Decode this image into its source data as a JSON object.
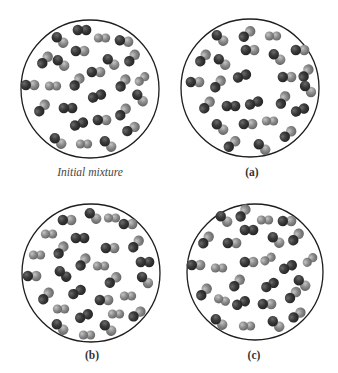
{
  "colors": {
    "dark_atom": "#343434",
    "dark_highlight": "#6a6a6a",
    "light_atom": "#8c8c8c",
    "light_highlight": "#c4c4c4",
    "circle_stroke": "#1e1e1e"
  },
  "legend": {
    "molecule_types": {
      "DD": "dark-dark diatomic molecule",
      "LL": "light-light diatomic molecule",
      "DL": "dark-light diatomic molecule"
    }
  },
  "panels": [
    {
      "id": "initial",
      "label": "Initial mixture",
      "label_style": "italic",
      "label_pos": [
        90,
        166
      ],
      "circle": {
        "cx": 90,
        "cy": 89,
        "r": 69
      },
      "molecules": [
        [
          82,
          30,
          0,
          "DD"
        ],
        [
          60,
          40,
          40,
          "DL"
        ],
        [
          102,
          38,
          0,
          "LL"
        ],
        [
          124,
          41,
          10,
          "DL"
        ],
        [
          80,
          51,
          0,
          "DL"
        ],
        [
          45,
          60,
          -50,
          "DL"
        ],
        [
          61,
          63,
          40,
          "DL"
        ],
        [
          111,
          62,
          40,
          "DL"
        ],
        [
          132,
          58,
          -50,
          "DL"
        ],
        [
          96,
          72,
          0,
          "DL"
        ],
        [
          30,
          85,
          0,
          "DL"
        ],
        [
          53,
          86,
          0,
          "LL"
        ],
        [
          77,
          82,
          -55,
          "DL"
        ],
        [
          142,
          79,
          -40,
          "LL"
        ],
        [
          123,
          83,
          -55,
          "DL"
        ],
        [
          97,
          96,
          -20,
          "DD"
        ],
        [
          140,
          98,
          50,
          "DL"
        ],
        [
          42,
          108,
          -50,
          "DL"
        ],
        [
          68,
          108,
          0,
          "DD"
        ],
        [
          123,
          112,
          -50,
          "DL"
        ],
        [
          79,
          124,
          -20,
          "DD"
        ],
        [
          102,
          120,
          0,
          "DL"
        ],
        [
          131,
          129,
          -30,
          "DL"
        ],
        [
          58,
          141,
          40,
          "DL"
        ],
        [
          84,
          144,
          0,
          "LL"
        ],
        [
          108,
          144,
          40,
          "DL"
        ]
      ]
    },
    {
      "id": "a",
      "label": "(a)",
      "label_style": "bold",
      "label_pos": [
        252,
        166
      ],
      "circle": {
        "cx": 250,
        "cy": 88,
        "r": 69
      },
      "molecules": [
        [
          220,
          38,
          40,
          "DL"
        ],
        [
          247,
          34,
          -40,
          "DL"
        ],
        [
          273,
          36,
          0,
          "LL"
        ],
        [
          250,
          50,
          0,
          "DL"
        ],
        [
          277,
          57,
          40,
          "DL"
        ],
        [
          300,
          50,
          0,
          "DL"
        ],
        [
          203,
          58,
          -50,
          "DL"
        ],
        [
          222,
          62,
          40,
          "DL"
        ],
        [
          242,
          76,
          -20,
          "DD"
        ],
        [
          287,
          77,
          0,
          "DL"
        ],
        [
          306,
          73,
          -55,
          "DL"
        ],
        [
          195,
          82,
          0,
          "DL"
        ],
        [
          218,
          84,
          -50,
          "DL"
        ],
        [
          308,
          89,
          45,
          "DL"
        ],
        [
          207,
          105,
          -50,
          "DL"
        ],
        [
          231,
          106,
          0,
          "DD"
        ],
        [
          254,
          103,
          -20,
          "DD"
        ],
        [
          283,
          100,
          -60,
          "DL"
        ],
        [
          300,
          110,
          -20,
          "DD"
        ],
        [
          220,
          127,
          40,
          "DL"
        ],
        [
          248,
          124,
          0,
          "DL"
        ],
        [
          270,
          121,
          0,
          "LL"
        ],
        [
          288,
          134,
          -40,
          "DL"
        ],
        [
          232,
          144,
          -40,
          "DL"
        ],
        [
          262,
          147,
          40,
          "DL"
        ]
      ]
    },
    {
      "id": "b",
      "label": "(b)",
      "label_style": "bold",
      "label_pos": [
        92,
        349
      ],
      "circle": {
        "cx": 91,
        "cy": 273,
        "r": 69
      },
      "molecules": [
        [
          67,
          220,
          0,
          "DL"
        ],
        [
          93,
          216,
          40,
          "DL"
        ],
        [
          112,
          218,
          0,
          "LL"
        ],
        [
          128,
          224,
          0,
          "DL"
        ],
        [
          49,
          234,
          0,
          "LL"
        ],
        [
          80,
          238,
          0,
          "DD"
        ],
        [
          61,
          250,
          -55,
          "DL"
        ],
        [
          110,
          248,
          0,
          "DL"
        ],
        [
          136,
          244,
          -50,
          "DL"
        ],
        [
          37,
          255,
          0,
          "LL"
        ],
        [
          83,
          262,
          -55,
          "DL"
        ],
        [
          101,
          266,
          0,
          "LL"
        ],
        [
          145,
          262,
          0,
          "DD"
        ],
        [
          32,
          276,
          0,
          "DL"
        ],
        [
          63,
          274,
          40,
          "DD"
        ],
        [
          113,
          280,
          -40,
          "DL"
        ],
        [
          145,
          280,
          45,
          "DL"
        ],
        [
          46,
          296,
          -50,
          "DL"
        ],
        [
          77,
          292,
          -30,
          "DD"
        ],
        [
          104,
          300,
          0,
          "DL"
        ],
        [
          128,
          296,
          0,
          "LL"
        ],
        [
          61,
          309,
          0,
          "LL"
        ],
        [
          84,
          316,
          -25,
          "DD"
        ],
        [
          116,
          314,
          0,
          "LL"
        ],
        [
          137,
          314,
          -35,
          "DL"
        ],
        [
          60,
          327,
          40,
          "DL"
        ],
        [
          108,
          328,
          40,
          "DL"
        ],
        [
          87,
          335,
          0,
          "LL"
        ]
      ]
    },
    {
      "id": "c",
      "label": "(c)",
      "label_style": "bold",
      "label_pos": [
        254,
        349
      ],
      "circle": {
        "cx": 255,
        "cy": 272,
        "r": 68
      },
      "molecules": [
        [
          224,
          219,
          40,
          "DL"
        ],
        [
          243,
          213,
          -55,
          "DL"
        ],
        [
          265,
          220,
          0,
          "LL"
        ],
        [
          287,
          221,
          0,
          "DL"
        ],
        [
          249,
          230,
          0,
          "DD"
        ],
        [
          206,
          240,
          -50,
          "DL"
        ],
        [
          232,
          243,
          0,
          "DL"
        ],
        [
          276,
          240,
          40,
          "DL"
        ],
        [
          296,
          237,
          -50,
          "DL"
        ],
        [
          196,
          265,
          0,
          "DL"
        ],
        [
          219,
          268,
          0,
          "LL"
        ],
        [
          249,
          262,
          0,
          "DL"
        ],
        [
          268,
          259,
          -30,
          "LL"
        ],
        [
          288,
          267,
          -25,
          "DD"
        ],
        [
          310,
          260,
          -40,
          "LL"
        ],
        [
          302,
          283,
          40,
          "DL"
        ],
        [
          237,
          283,
          -50,
          "DL"
        ],
        [
          270,
          285,
          -30,
          "DD"
        ],
        [
          204,
          292,
          -50,
          "DL"
        ],
        [
          222,
          300,
          20,
          "LL"
        ],
        [
          241,
          303,
          -25,
          "DD"
        ],
        [
          267,
          304,
          0,
          "DL"
        ],
        [
          293,
          295,
          -45,
          "DL"
        ],
        [
          297,
          315,
          -35,
          "DL"
        ],
        [
          219,
          322,
          40,
          "DL"
        ],
        [
          247,
          326,
          0,
          "LL"
        ],
        [
          276,
          324,
          40,
          "DL"
        ]
      ]
    }
  ]
}
